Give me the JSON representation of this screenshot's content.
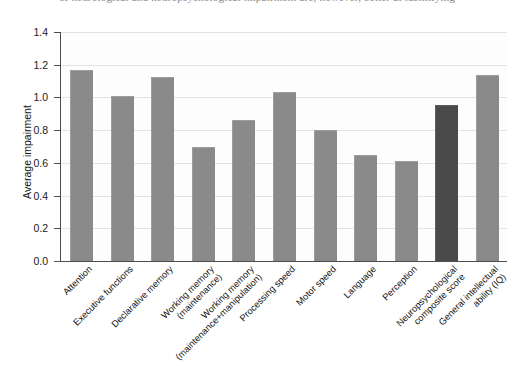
{
  "page_fragment": "of neurological and neuropsychological impairment are, however, better at identifying",
  "chart_data": {
    "type": "bar",
    "title": "",
    "xlabel": "",
    "ylabel": "Average impairment",
    "ylim": [
      0.0,
      1.4
    ],
    "yticks": [
      "0.0",
      "0.2",
      "0.4",
      "0.6",
      "0.8",
      "1.0",
      "1.2",
      "1.4"
    ],
    "ytick_values": [
      0.0,
      0.2,
      0.4,
      0.6,
      0.8,
      1.0,
      1.2,
      1.4
    ],
    "grid": "horizontal",
    "legend": "none",
    "bar_color": "#8a8a8a",
    "highlight_color": "#4a4a4a",
    "categories": [
      "Attention",
      "Executive functions",
      "Declarative memory",
      "Working memory (maintenance)",
      "Working memory (maintenance+manipulation)",
      "Processing speed",
      "Motor speed",
      "Language",
      "Perception",
      "Neuropsychological composite score",
      "General intellectual ability (IQ)"
    ],
    "category_lines": [
      [
        "Attention"
      ],
      [
        "Executive functions"
      ],
      [
        "Declarative memory"
      ],
      [
        "Working memory",
        "(maintenance)"
      ],
      [
        "Working memory",
        "(maintenance+manipulation)"
      ],
      [
        "Processing speed"
      ],
      [
        "Motor speed"
      ],
      [
        "Language"
      ],
      [
        "Perception"
      ],
      [
        "Neuropsychological",
        "composite score"
      ],
      [
        "General intellectual",
        "ability (IQ)"
      ]
    ],
    "values": [
      1.16,
      1.0,
      1.12,
      0.69,
      0.855,
      1.03,
      0.795,
      0.64,
      0.605,
      0.945,
      1.13
    ],
    "highlighted_categories": [
      "Neuropsychological composite score"
    ]
  }
}
